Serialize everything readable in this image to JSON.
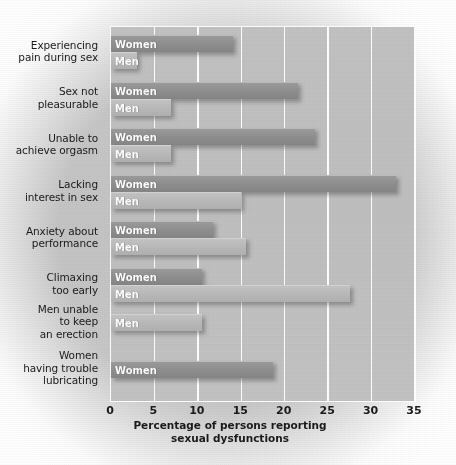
{
  "chart_data": {
    "type": "bar",
    "orientation": "horizontal",
    "title": "",
    "xlabel": "Percentage of persons reporting\nsexual dysfunctions",
    "ylabel": "",
    "xlim": [
      0,
      35
    ],
    "xticks": [
      0,
      5,
      10,
      15,
      20,
      25,
      30,
      35
    ],
    "xtick_labels": [
      "0",
      "5",
      "10",
      "15",
      "20",
      "25",
      "30",
      "35"
    ],
    "grid": "vertical-white",
    "legend": "in-bar-labels",
    "series_names": [
      "Women",
      "Men"
    ],
    "categories": [
      "Experiencing\npain during sex",
      "Sex not\npleasurable",
      "Unable to\nachieve orgasm",
      "Lacking\ninterest in sex",
      "Anxiety about\nperformance",
      "Climaxing\ntoo early",
      "Men unable\nto keep\nan erection",
      "Women\nhaving trouble\nlubricating"
    ],
    "groups": [
      {
        "category": "Experiencing\npain during sex",
        "bars": [
          {
            "series": "Women",
            "label": "Women",
            "value": 14.0
          },
          {
            "series": "Men",
            "label": "Men",
            "value": 3.0
          }
        ]
      },
      {
        "category": "Sex not\npleasurable",
        "bars": [
          {
            "series": "Women",
            "label": "Women",
            "value": 21.5
          },
          {
            "series": "Men",
            "label": "Men",
            "value": 6.9
          }
        ]
      },
      {
        "category": "Unable to\nachieve orgasm",
        "bars": [
          {
            "series": "Women",
            "label": "Women",
            "value": 23.5
          },
          {
            "series": "Men",
            "label": "Men",
            "value": 6.9
          }
        ]
      },
      {
        "category": "Lacking\ninterest in sex",
        "bars": [
          {
            "series": "Women",
            "label": "Women",
            "value": 32.8
          },
          {
            "series": "Men",
            "label": "Men",
            "value": 15.0
          }
        ]
      },
      {
        "category": "Anxiety about\nperformance",
        "bars": [
          {
            "series": "Women",
            "label": "Women",
            "value": 11.7
          },
          {
            "series": "Men",
            "label": "Men",
            "value": 15.5
          }
        ]
      },
      {
        "category": "Climaxing\ntoo early",
        "bars": [
          {
            "series": "Women",
            "label": "Women",
            "value": 10.5
          },
          {
            "series": "Men",
            "label": "Men",
            "value": 27.5
          }
        ]
      },
      {
        "category": "Men unable\nto keep\nan erection",
        "bars": [
          {
            "series": "Men",
            "label": "Men",
            "value": 10.5
          }
        ]
      },
      {
        "category": "Women\nhaving trouble\nlubricating",
        "bars": [
          {
            "series": "Women",
            "label": "Women",
            "value": 18.7
          }
        ]
      }
    ],
    "colors": {
      "women_bar": "#8e8e8e",
      "men_bar": "#b9b9b9",
      "plot_background": "#c0c0c0",
      "figure_background": "#c6c6c6",
      "gridline": "#ffffff",
      "bar_label_text": "#ffffff",
      "axis_text": "#1a1a1a"
    }
  }
}
